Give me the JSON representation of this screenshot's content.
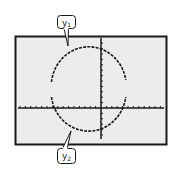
{
  "figure": {
    "type": "graphing-calculator-screen",
    "screen_background": "#ececec",
    "page_background": "#ffffff",
    "stroke_color": "#1a1a1a",
    "callouts": [
      {
        "id": "y1",
        "label": "y",
        "subscript": "1",
        "describes": "upper semicircle"
      },
      {
        "id": "y2",
        "label": "y",
        "subscript": "2",
        "describes": "lower semicircle"
      }
    ],
    "axes": {
      "x_axis": {
        "ticks": true,
        "tick_count_left": 15,
        "tick_count_right": 11
      },
      "y_axis": {
        "ticks": true,
        "tick_count_up": 12,
        "tick_count_down": 5
      }
    },
    "curve": {
      "shape": "circle",
      "plotted_as": "two halves (y1 top, y2 bottom)",
      "gaps_at_left_and_right_edges": true
    }
  }
}
